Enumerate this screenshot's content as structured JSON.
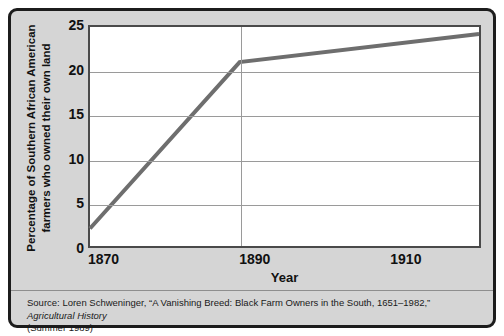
{
  "chart_data": {
    "type": "line",
    "title": "",
    "xlabel": "Year",
    "ylabel": "Percentage of Southern African American farmers who owned their own land",
    "ylabel_line1": "Percentage of Southern African American",
    "ylabel_line2": "farmers who owned their own land",
    "xlim": [
      1870,
      1922
    ],
    "ylim": [
      0,
      25
    ],
    "x_tick_labels": [
      "1870",
      "1890",
      "1910"
    ],
    "x_ticks": [
      1870,
      1890,
      1910
    ],
    "y_tick_labels": [
      "0",
      "5",
      "10",
      "15",
      "20",
      "25"
    ],
    "y_ticks": [
      0,
      5,
      10,
      15,
      20,
      25
    ],
    "grid": {
      "horizontal": true,
      "vertical_at": [
        1890
      ]
    },
    "legend": null,
    "series": [
      {
        "name": "Percentage owning land",
        "color": "#6e6e6e",
        "line_width": 4,
        "x": [
          1870,
          1890,
          1922
        ],
        "values": [
          2,
          21,
          24.2
        ]
      }
    ]
  },
  "source": {
    "line1_prefix": "Source: Loren Schweninger, “A Vanishing Breed: Black Farm Owners in the South, 1651–1982,” ",
    "line1_italic": "Agricultural History",
    "line2": "(Summer 1989)"
  },
  "colors": {
    "frame_background": "#d5d5d5",
    "frame_border": "#1c1c1c",
    "plot_background": "#ffffff",
    "plot_border": "#4a4a4a",
    "gridline": "#9a9a9a",
    "series": "#6e6e6e",
    "text": "#111111"
  }
}
